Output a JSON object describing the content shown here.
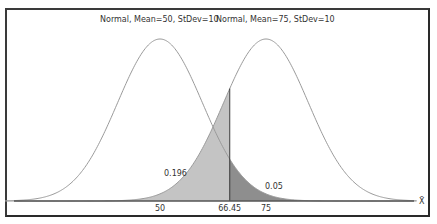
{
  "chart_data": {
    "type": "area",
    "title": "",
    "legend": [
      "Normal, Mean=50, StDev=10",
      "Normal, Mean=75, StDev=10"
    ],
    "series": [
      {
        "name": "Normal, Mean=50, StDev=10",
        "mean": 50,
        "stdev": 10
      },
      {
        "name": "Normal, Mean=75, StDev=10",
        "mean": 75,
        "stdev": 10
      }
    ],
    "critical_value": 66.45,
    "shaded_regions": [
      {
        "label": "0.196",
        "description": "Area under Mean=75 curve left of 66.45",
        "color": "#c4c4c4"
      },
      {
        "label": "0.05",
        "description": "Area under Mean=50 curve right of 66.45",
        "color": "#8e8e8e"
      }
    ],
    "x_tick_labels": [
      "50",
      "66.45",
      "75"
    ],
    "xlabel": "X̄",
    "ylabel": "",
    "xlim": [
      13.5,
      110.5
    ],
    "grid": false,
    "legend_position": "top"
  },
  "labels": {
    "legend_left": "Normal, Mean=50, StDev=10",
    "legend_right": "Normal, Mean=75, StDev=10",
    "area_beta": "0.196",
    "area_alpha": "0.05",
    "tick_50": "50",
    "tick_crit": "66.45",
    "tick_75": "75",
    "x_axis_label": "X̄"
  }
}
